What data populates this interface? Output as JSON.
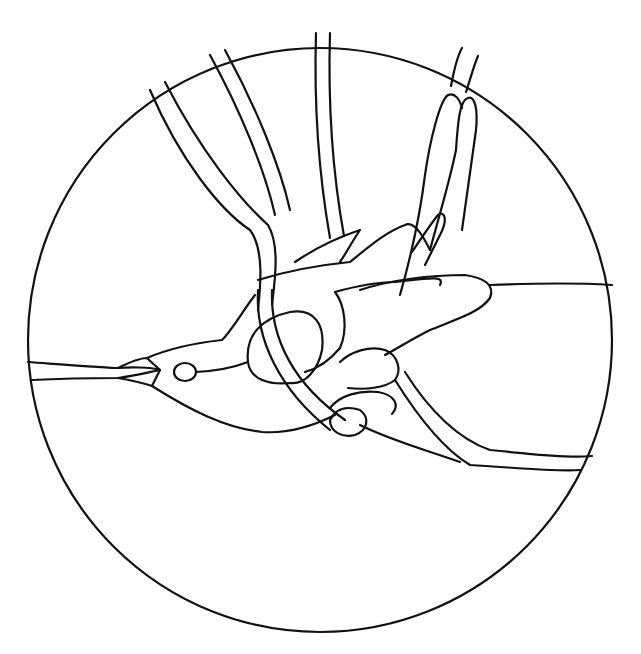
{
  "artwork": {
    "subject": "hummingbird stained-glass pattern",
    "style": "black line art on white",
    "colors": {
      "background": "#ffffff",
      "line": "#111111"
    },
    "elements": [
      "circular-frame",
      "hummingbird-beak",
      "hummingbird-eye",
      "hummingbird-head",
      "hummingbird-body",
      "hummingbird-wings",
      "hummingbird-tail-feathers",
      "vine-stems",
      "horizontal-lead-lines"
    ]
  }
}
